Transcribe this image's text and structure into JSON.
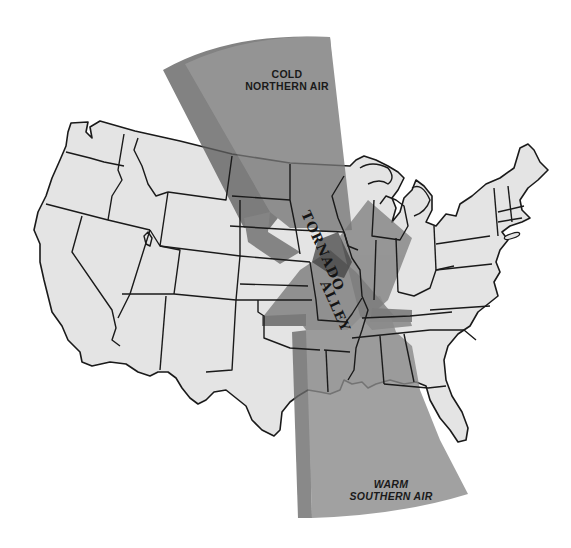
{
  "figure": {
    "title": "Tornado Alley",
    "colors": {
      "background": "#ffffff",
      "land": "#e4e4e4",
      "state_lines": "#1a1a1a",
      "cold_air_mass": "#777777",
      "cold_air_mass_edge": "#5f5f5f",
      "warm_air_mass": "#8a8a8a",
      "warm_air_mass_edge": "#6c6c6c",
      "overlap": "#4e4e4e",
      "label_text": "#1a1a1a"
    }
  },
  "labels": {
    "cold_air": {
      "line1": "COLD",
      "line2": "NORTHERN AIR"
    },
    "warm_air": {
      "line1": "WARM",
      "line2": "SOUTHERN AIR"
    },
    "tornado_alley": {
      "word1": "TORNADO",
      "word2": "ALLEY"
    }
  },
  "air_masses": [
    {
      "name": "Cold Northern Air",
      "origin": "north",
      "direction": "southeast"
    },
    {
      "name": "Warm Southern Air",
      "origin": "south (Gulf of Mexico)",
      "direction": "north"
    }
  ]
}
